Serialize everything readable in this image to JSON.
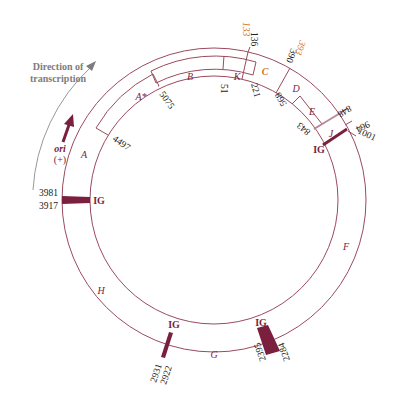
{
  "colors": {
    "line": "#9a4a5e",
    "ig_fill": "#7a1f3d",
    "gene_label": "#7a1f3d",
    "highlight": "#d2742b",
    "direction": "#7d7d7d"
  },
  "direction": {
    "line1": "Direction of",
    "line2": "transcription"
  },
  "ori": {
    "label": "ori",
    "sign": "(+)"
  },
  "genes": {
    "A": "A",
    "A_star": "A*",
    "B": "B",
    "K": "K",
    "C": "C",
    "D": "D",
    "E": "E",
    "J": "J",
    "F": "F",
    "G": "G",
    "H": "H"
  },
  "intergenic": {
    "label": "IG",
    "regions": [
      {
        "start": "1001",
        "label": "IG"
      },
      {
        "start": "2284",
        "end": "2395",
        "label": "IG"
      },
      {
        "start": "2922",
        "end": "2931",
        "label": "IG"
      },
      {
        "start": "3917",
        "end": "3981",
        "label": "IG"
      }
    ]
  },
  "positions": {
    "p133": "133",
    "p136": "136",
    "p393": "393",
    "p390": "390",
    "p51": "51",
    "p221": "221",
    "p568": "568",
    "p848": "848",
    "p843": "843",
    "p964": "964",
    "p1001": "1001",
    "p2284": "2284",
    "p2395": "2395",
    "p2922": "2922",
    "p2931": "2931",
    "p3917": "3917",
    "p3981": "3981",
    "p4497": "4497",
    "p5075": "5075"
  }
}
